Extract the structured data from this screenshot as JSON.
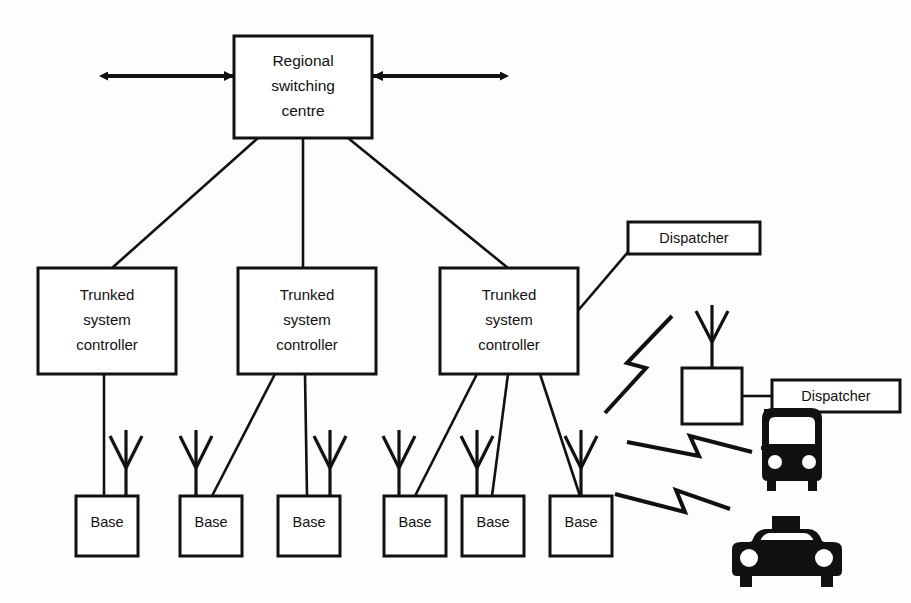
{
  "diagram": {
    "colors": {
      "ink": "#111111",
      "paper": "#fdfdfb",
      "box_fill": "#ffffff"
    },
    "regional_centre": {
      "name": "regional-switching-centre",
      "line1": "Regional",
      "line2": "switching",
      "line3": "centre"
    },
    "controllers": [
      {
        "id": "controller-1",
        "line1": "Trunked",
        "line2": "system",
        "line3": "controller"
      },
      {
        "id": "controller-2",
        "line1": "Trunked",
        "line2": "system",
        "line3": "controller"
      },
      {
        "id": "controller-3",
        "line1": "Trunked",
        "line2": "system",
        "line3": "controller"
      }
    ],
    "base_stations": [
      {
        "id": "base-1",
        "label": "Base"
      },
      {
        "id": "base-2",
        "label": "Base"
      },
      {
        "id": "base-3",
        "label": "Base"
      },
      {
        "id": "base-4",
        "label": "Base"
      },
      {
        "id": "base-5",
        "label": "Base"
      },
      {
        "id": "base-6",
        "label": "Base"
      }
    ],
    "dispatchers": [
      {
        "id": "dispatcher-wired",
        "label": "Dispatcher"
      },
      {
        "id": "dispatcher-remote",
        "label": "Dispatcher"
      }
    ],
    "remote_base": {
      "id": "remote-base-unit",
      "label": ""
    },
    "vehicles": [
      {
        "id": "bus",
        "icon": "bus-icon"
      },
      {
        "id": "taxi",
        "icon": "taxi-icon"
      }
    ],
    "rf_links": [
      {
        "id": "rf-link-dispatcher",
        "icon": "lightning-bolt-icon"
      },
      {
        "id": "rf-link-bus",
        "icon": "lightning-bolt-icon"
      },
      {
        "id": "rf-link-taxi",
        "icon": "lightning-bolt-icon"
      }
    ],
    "trunk_arrows": [
      {
        "id": "trunk-arrow-left",
        "icon": "double-arrow-icon"
      },
      {
        "id": "trunk-arrow-right",
        "icon": "double-arrow-icon"
      }
    ]
  }
}
